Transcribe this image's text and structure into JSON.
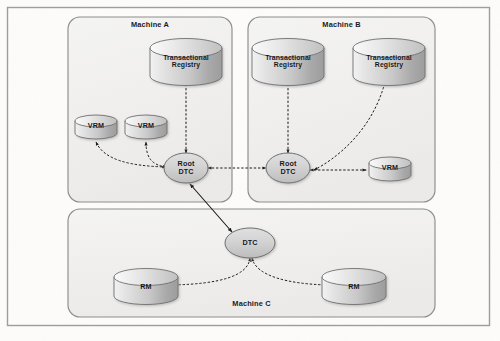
{
  "figure": {
    "type": "node-link-diagram",
    "background_color": "#fdfdfd",
    "outer_frame_color": "#9a9a9a"
  },
  "machines": [
    {
      "id": "machine-a",
      "label": "Machine A",
      "label_position": "top-center",
      "box": {
        "x": 68,
        "y": 17,
        "w": 164,
        "h": 185
      }
    },
    {
      "id": "machine-b",
      "label": "Machine B",
      "label_position": "top-center",
      "box": {
        "x": 248,
        "y": 17,
        "w": 187,
        "h": 185
      }
    },
    {
      "id": "machine-c",
      "label": "Machine C",
      "label_position": "bottom-center",
      "box": {
        "x": 68,
        "y": 209,
        "w": 367,
        "h": 108
      }
    }
  ],
  "nodes": [
    {
      "id": "tr-a",
      "shape": "cylinder",
      "label": "Transactional Registry",
      "machine": "machine-a",
      "cx": 186,
      "cy": 62
    },
    {
      "id": "vrm-a1",
      "shape": "cylinder",
      "label": "VRM",
      "machine": "machine-a",
      "cx": 96,
      "cy": 128
    },
    {
      "id": "vrm-a2",
      "shape": "cylinder",
      "label": "VRM",
      "machine": "machine-a",
      "cx": 146,
      "cy": 128
    },
    {
      "id": "rootdtc-a",
      "shape": "ellipse",
      "label": "Root DTC",
      "machine": "machine-a",
      "cx": 186,
      "cy": 168
    },
    {
      "id": "tr-b1",
      "shape": "cylinder",
      "label": "Transactional Registry",
      "machine": "machine-b",
      "cx": 288,
      "cy": 62
    },
    {
      "id": "tr-b2",
      "shape": "cylinder",
      "label": "Transactional Registry",
      "machine": "machine-b",
      "cx": 389,
      "cy": 62
    },
    {
      "id": "rootdtc-b",
      "shape": "ellipse",
      "label": "Root DTC",
      "machine": "machine-b",
      "cx": 288,
      "cy": 168
    },
    {
      "id": "vrm-b",
      "shape": "cylinder",
      "label": "VRM",
      "machine": "machine-b",
      "cx": 390,
      "cy": 170
    },
    {
      "id": "dtc-c",
      "shape": "ellipse",
      "label": "DTC",
      "machine": "machine-c",
      "cx": 250,
      "cy": 243
    },
    {
      "id": "rm-c1",
      "shape": "cylinder",
      "label": "RM",
      "machine": "machine-c",
      "cx": 146,
      "cy": 287
    },
    {
      "id": "rm-c2",
      "shape": "cylinder",
      "label": "RM",
      "machine": "machine-c",
      "cx": 354,
      "cy": 287
    }
  ],
  "edges": [
    {
      "from": "rootdtc-a",
      "to": "tr-a",
      "style": "dotted",
      "arrows": "both"
    },
    {
      "from": "rootdtc-a",
      "to": "vrm-a1",
      "style": "dotted",
      "arrows": "both"
    },
    {
      "from": "rootdtc-a",
      "to": "vrm-a2",
      "style": "dotted",
      "arrows": "both"
    },
    {
      "from": "rootdtc-a",
      "to": "rootdtc-b",
      "style": "dotted",
      "arrows": "both"
    },
    {
      "from": "rootdtc-b",
      "to": "tr-b1",
      "style": "dotted",
      "arrows": "both"
    },
    {
      "from": "rootdtc-b",
      "to": "vrm-b",
      "style": "dotted",
      "arrows": "both"
    },
    {
      "from": "vrm-b",
      "to": "tr-b2",
      "style": "dotted",
      "arrows": "both"
    },
    {
      "from": "rootdtc-a",
      "to": "dtc-c",
      "style": "solid",
      "arrows": "both"
    },
    {
      "from": "dtc-c",
      "to": "rm-c1",
      "style": "dotted",
      "arrows": "both"
    },
    {
      "from": "dtc-c",
      "to": "rm-c2",
      "style": "dotted",
      "arrows": "both"
    }
  ],
  "labels": {
    "machine_a": "Machine A",
    "machine_b": "Machine B",
    "machine_c": "Machine C",
    "transactional": "Transactional",
    "registry": "Registry",
    "vrm": "VRM",
    "rm": "RM",
    "root": "Root",
    "dtc": "DTC"
  }
}
